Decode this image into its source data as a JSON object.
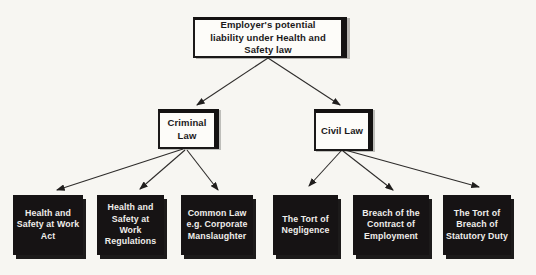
{
  "diagram": {
    "title": "Employer's potential liability under Health and Safety law",
    "root": {
      "label": "Employer's potential liability under Health and Safety law"
    },
    "branches": [
      {
        "id": "criminal",
        "label": "Criminal Law"
      },
      {
        "id": "civil",
        "label": "Civil Law"
      }
    ],
    "leaves": [
      {
        "parent": "criminal",
        "label": "Health and Safety at Work Act"
      },
      {
        "parent": "criminal",
        "label": "Health and Safety at Work Regulations"
      },
      {
        "parent": "criminal",
        "label": "Common Law e.g. Corporate Manslaughter"
      },
      {
        "parent": "civil",
        "label": "The Tort of Negligence"
      },
      {
        "parent": "civil",
        "label": "Breach of the Contract of Employment"
      },
      {
        "parent": "civil",
        "label": "The Tort of Breach of Statutory Duty"
      }
    ],
    "colors": {
      "background": "#f7f6f2",
      "box_fill_light": "#fdfcf9",
      "box_fill_dark": "#161314",
      "text_dark": "#1b1919",
      "text_light": "#efedea",
      "connector": "#2e2c2b"
    }
  }
}
